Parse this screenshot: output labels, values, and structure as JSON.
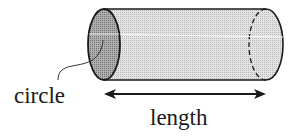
{
  "diagram": {
    "labels": {
      "circle": "circle",
      "length": "length"
    },
    "colors": {
      "outline": "#1a1a1a",
      "body_fill": "#d9d9d9",
      "end_cap_fill": "#a8a8a8",
      "highlight": "#ffffff"
    },
    "arrow": {
      "type": "double-headed",
      "meaning": "length"
    }
  }
}
